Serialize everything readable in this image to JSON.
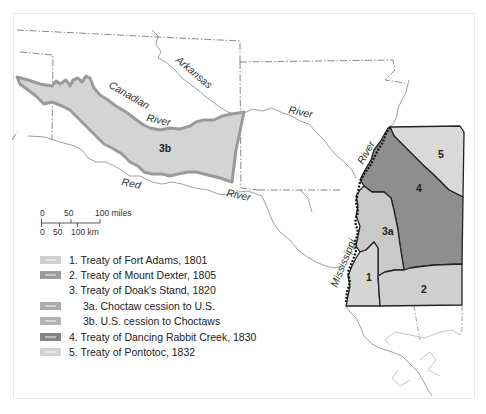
{
  "map": {
    "rivers": {
      "arkansas": "Arkansas",
      "canadian": "Canadian",
      "canadian_river": "River",
      "arkansas_river": "River",
      "red": "Red",
      "red_river": "River",
      "mississippi": "Mississippi",
      "mississippi_river": "River"
    },
    "regions": {
      "r1": "1",
      "r2": "2",
      "r3a": "3a",
      "r3b": "3b",
      "r4": "4",
      "r5": "5"
    },
    "colors": {
      "r1": "#d6d6d6",
      "r2": "#cfcfcf",
      "r3a": "#c9c9c9",
      "r3b": "#d4d4d4",
      "r3b_border": "#9a9a9a",
      "r4": "#8e8e8e",
      "r5": "#d9d9d9",
      "boundary": "#222222",
      "state_line": "#7a7a7a",
      "river_line": "#777777"
    }
  },
  "scale_bar": {
    "miles_ticks": [
      "0",
      "50",
      "100 miles"
    ],
    "km_ticks": [
      "0",
      "50",
      "100 km"
    ]
  },
  "legend": {
    "items": [
      {
        "label": "1. Treaty of Fort Adams, 1801",
        "swatch": "#cfcfcf"
      },
      {
        "label": "2. Treaty of Mount Dexter, 1805",
        "swatch": "#9c9c9c"
      },
      {
        "label": "3. Treaty of Doak's Stand, 1820",
        "swatch": ""
      },
      {
        "label": "3a. Choctaw cession to U.S.",
        "swatch": "#ababab"
      },
      {
        "label": "3b. U.S. cession to Choctaws",
        "swatch": "#b3b3b3"
      },
      {
        "label": "4. Treaty of Dancing Rabbit Creek, 1830",
        "swatch": "#858585"
      },
      {
        "label": "5. Treaty of Pontotoc, 1832",
        "swatch": "#d2d2d2"
      }
    ]
  }
}
